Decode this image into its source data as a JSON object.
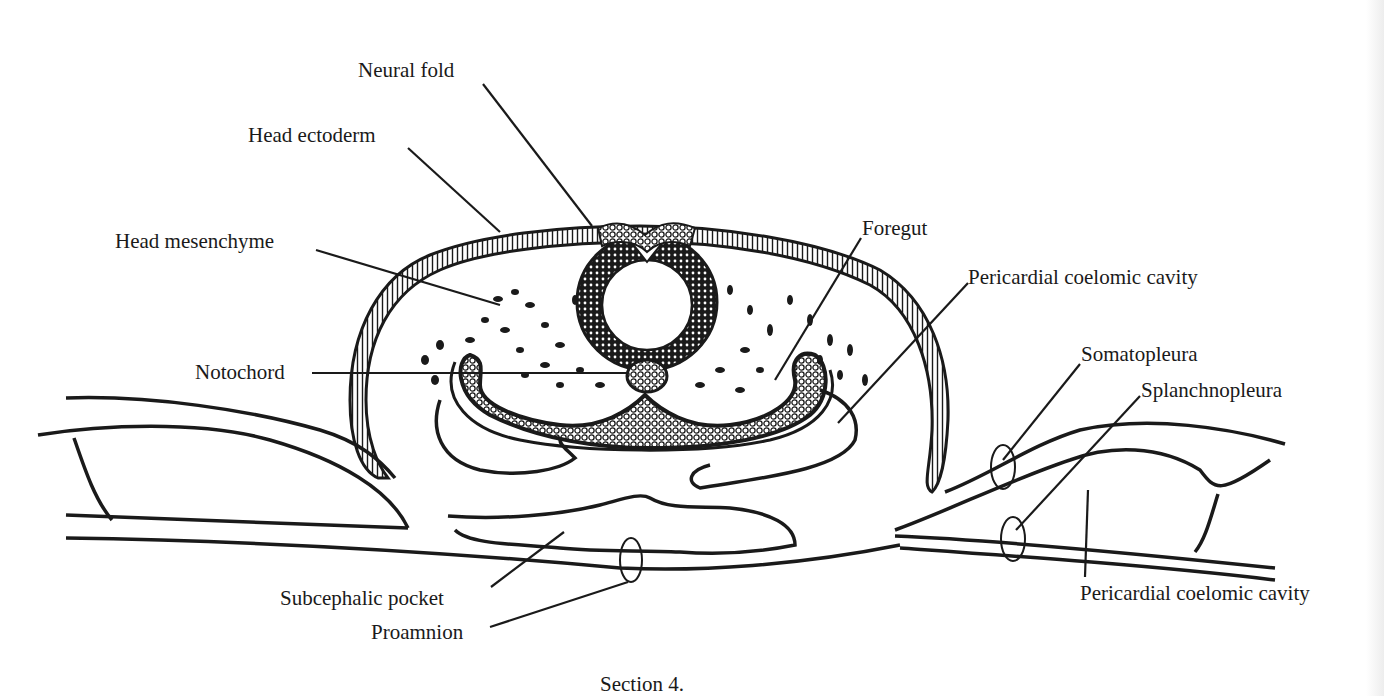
{
  "figure": {
    "caption": "Section 4.",
    "labels": {
      "neural_fold": "Neural fold",
      "head_ectoderm": "Head ectoderm",
      "head_mesenchyme": "Head mesenchyme",
      "notochord": "Notochord",
      "foregut": "Foregut",
      "pericardial_coelomic_cavity_upper": "Pericardial coelomic cavity",
      "somatopleura": "Somatopleura",
      "splanchnopleura": "Splanchnopleura",
      "subcephalic_pocket": "Subcephalic pocket",
      "proamnion": "Proamnion",
      "pericardial_coelomic_cavity_lower": "Pericardial coelomic cavity"
    },
    "colors": {
      "ink": "#1a1a1a",
      "paper": "#ffffff"
    }
  }
}
